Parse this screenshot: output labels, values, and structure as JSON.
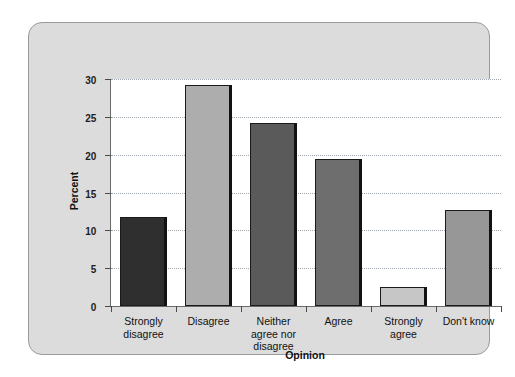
{
  "chart_data": {
    "type": "bar",
    "title": "",
    "xlabel": "Opinion",
    "ylabel": "Percent",
    "categories": [
      "Strongly\ndisagree",
      "Disagree",
      "Neither\nagree nor\ndisagree",
      "Agree",
      "Strongly\nagree",
      "Don't know"
    ],
    "values": [
      11.7,
      29.2,
      24.2,
      19.4,
      2.5,
      12.7
    ],
    "ylim": [
      0,
      30
    ],
    "yticks": [
      0,
      5,
      10,
      15,
      20,
      25,
      30
    ],
    "ytick_labels": [
      "0",
      "5",
      "10",
      "15",
      "20",
      "25",
      "30"
    ],
    "grid": true,
    "legend": "none",
    "bar_colors": [
      "#2f2f2f",
      "#adadad",
      "#5a5a5a",
      "#6e6e6e",
      "#c6c6c6",
      "#979797"
    ]
  },
  "style": {
    "panel_background": "#dcdcdc",
    "panel_border": "#9a9a9a",
    "plot_background": "#ffffff",
    "axis_color": "#4a4a4a",
    "gridline_color": "#9fa6ae",
    "text_color": "#111111"
  }
}
